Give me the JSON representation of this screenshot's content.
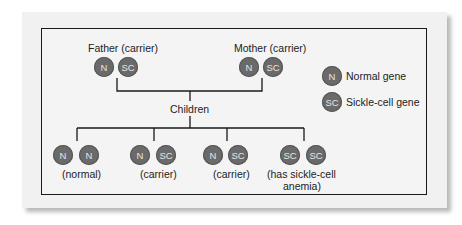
{
  "parents": {
    "father": {
      "label": "Father (carrier)",
      "genes": [
        "N",
        "SC"
      ]
    },
    "mother": {
      "label": "Mother (carrier)",
      "genes": [
        "N",
        "SC"
      ]
    }
  },
  "children_label": "Children",
  "children": [
    {
      "genes": [
        "N",
        "N"
      ],
      "label": "(normal)"
    },
    {
      "genes": [
        "N",
        "SC"
      ],
      "label": "(carrier)"
    },
    {
      "genes": [
        "N",
        "SC"
      ],
      "label": "(carrier)"
    },
    {
      "genes": [
        "SC",
        "SC"
      ],
      "label_line1": "(has sickle-cell",
      "label_line2": "anemia)"
    }
  ],
  "legend": [
    {
      "symbol": "N",
      "label": "Normal gene"
    },
    {
      "symbol": "SC",
      "label": "Sickle-cell gene"
    }
  ],
  "colors": {
    "gene_fill": "#6a6a6a",
    "gene_text": "#e6e6e6",
    "line": "#1a1a1a",
    "background": "#f1f1f1"
  }
}
